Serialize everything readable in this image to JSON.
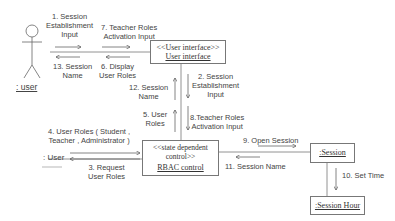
{
  "diagram": {
    "type": "uml-collaboration",
    "actor": {
      "label": ": user"
    },
    "external_object": {
      "label": ": User"
    },
    "objects": {
      "user_interface": {
        "stereotype": "<<User interface>>",
        "name": "User interface"
      },
      "rbac_control": {
        "stereotype_line1": "<<state dependent",
        "stereotype_line2": "control>>",
        "name": "RBAC control"
      },
      "session": {
        "name": ":Session"
      },
      "session_hour": {
        "name": ":Session Hour"
      }
    },
    "messages": {
      "m1": {
        "line1": "1. Session",
        "line2": "Establishment",
        "line3": "Input"
      },
      "m13": {
        "line1": "13. Session",
        "line2": "Name"
      },
      "m7": {
        "line1": "7. Teacher Roles",
        "line2": "Activation Input"
      },
      "m6": {
        "line1": "6. Display",
        "line2": "User Roles"
      },
      "m2": {
        "line1": "2. Session",
        "line2": "Establishment",
        "line3": "Input"
      },
      "m12": {
        "line1": "12. Session",
        "line2": "Name"
      },
      "m5": {
        "line1": "5. User",
        "line2": "Roles"
      },
      "m8": {
        "line1": "8.Teacher Roles",
        "line2": "Activation Input"
      },
      "m4": {
        "line1": "4. User Roles  ( Student ,",
        "line2": "Teacher ,  Administrator )"
      },
      "m3": {
        "line1": "3. Request",
        "line2": "User Roles"
      },
      "m9": {
        "line1": "9. Open Session"
      },
      "m11": {
        "line1": "11. Session Name"
      },
      "m10": {
        "line1": "10. Set Time"
      }
    }
  }
}
